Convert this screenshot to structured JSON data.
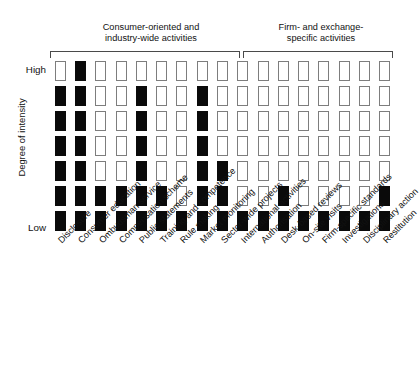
{
  "chart_data": {
    "type": "heatmap",
    "title": "",
    "xlabel": "",
    "ylabel": "Degree of intensity",
    "y_axis": {
      "top_label": "High",
      "bottom_label": "Low",
      "rows": 7,
      "direction": "Low at bottom, High at top"
    },
    "grid": true,
    "legend": "none",
    "notation": "Each column is an activity; filled (black) blocks stacked from the bottom indicate the degree of intensity reached for that activity. Level 1 = Low, Level 7 = High.",
    "groups": [
      {
        "name": "Consumer-oriented and industry-wide activities",
        "label_lines": [
          "Consumer-oriented and",
          "industry-wide activities"
        ],
        "column_start": 1,
        "column_end": 10
      },
      {
        "name": "Firm- and exchange-specific activities",
        "label_lines": [
          "Firm- and exchange-",
          "specific activities"
        ],
        "column_start": 11,
        "column_end": 17
      }
    ],
    "categories": [
      "Disclosure",
      "Consumer education",
      "Ombudsman service",
      "Compensation scheme",
      "Public statements",
      "Training and competence",
      "Rule making",
      "Market monitoring",
      "Sector-wide projects",
      "International activities",
      "Authorisation",
      "Desk-based reviews",
      "On-site visits",
      "Firm-specific standards",
      "Investigations",
      "Disciplinary action",
      "Restitution"
    ],
    "values": [
      6,
      7,
      2,
      2,
      6,
      2,
      1,
      6,
      3,
      1,
      1,
      2,
      1,
      1,
      1,
      1,
      2
    ],
    "ylim": [
      0,
      7
    ],
    "matrix_note": "matrix[rowIndex][colIndex], rowIndex 0 = High (top) .. 6 = Low (bottom); 1 = filled black, 0 = empty",
    "matrix": [
      [
        0,
        1,
        0,
        0,
        0,
        0,
        0,
        0,
        0,
        0,
        0,
        0,
        0,
        0,
        0,
        0,
        0
      ],
      [
        1,
        1,
        0,
        0,
        1,
        0,
        0,
        1,
        0,
        0,
        0,
        0,
        0,
        0,
        0,
        0,
        0
      ],
      [
        1,
        1,
        0,
        0,
        1,
        0,
        0,
        1,
        0,
        0,
        0,
        0,
        0,
        0,
        0,
        0,
        0
      ],
      [
        1,
        1,
        0,
        0,
        1,
        0,
        0,
        1,
        0,
        0,
        0,
        0,
        0,
        0,
        0,
        0,
        0
      ],
      [
        1,
        1,
        0,
        0,
        1,
        0,
        0,
        1,
        1,
        0,
        0,
        0,
        0,
        0,
        0,
        0,
        0
      ],
      [
        1,
        1,
        1,
        1,
        1,
        1,
        0,
        1,
        1,
        0,
        0,
        1,
        0,
        0,
        0,
        0,
        1
      ],
      [
        1,
        1,
        1,
        1,
        1,
        1,
        1,
        1,
        1,
        1,
        1,
        1,
        1,
        1,
        1,
        1,
        1
      ]
    ]
  }
}
